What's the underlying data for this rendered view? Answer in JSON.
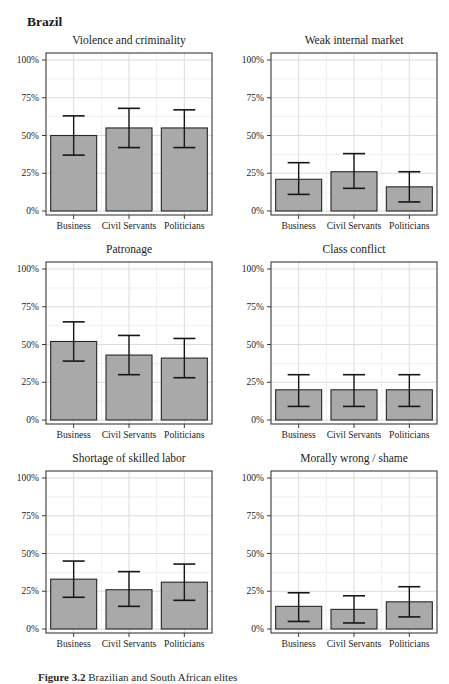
{
  "page": {
    "title": "Brazil",
    "caption": {
      "label": "Figure 3.2",
      "text": "Brazilian and South African elites"
    }
  },
  "style": {
    "bar_fill": "#a9a9a9",
    "bar_stroke": "#262626",
    "errorbar_color": "#161616",
    "grid_major_color": "#dcdcdc",
    "grid_minor_color": "#f0f0f0",
    "panel_border_color": "#3a3a3a",
    "tick_color": "#3a3a3a",
    "background": "#ffffff"
  },
  "axis": {
    "y_ticks_percent": [
      0,
      25,
      50,
      75,
      100
    ],
    "y_tick_labels": [
      "0%",
      "25%",
      "50%",
      "75%",
      "100%"
    ],
    "y_minor_ticks_percent": [
      12.5,
      37.5,
      62.5,
      87.5
    ],
    "ylim": [
      0,
      100
    ],
    "categories": [
      "Business",
      "Civil Servants",
      "Politicians"
    ]
  },
  "chart_data": [
    {
      "type": "bar",
      "title": "Violence and criminality",
      "categories": [
        "Business",
        "Civil Servants",
        "Politicians"
      ],
      "values": [
        50,
        55,
        55
      ],
      "ci_low": [
        37,
        42,
        42
      ],
      "ci_high": [
        63,
        68,
        67
      ],
      "ylim": [
        0,
        100
      ],
      "grid": true,
      "legend": "none"
    },
    {
      "type": "bar",
      "title": "Weak internal market",
      "categories": [
        "Business",
        "Civil Servants",
        "Politicians"
      ],
      "values": [
        21,
        26,
        16
      ],
      "ci_low": [
        11,
        15,
        6
      ],
      "ci_high": [
        32,
        38,
        26
      ],
      "ylim": [
        0,
        100
      ],
      "grid": true,
      "legend": "none"
    },
    {
      "type": "bar",
      "title": "Patronage",
      "categories": [
        "Business",
        "Civil Servants",
        "Politicians"
      ],
      "values": [
        52,
        43,
        41
      ],
      "ci_low": [
        39,
        30,
        28
      ],
      "ci_high": [
        65,
        56,
        54
      ],
      "ylim": [
        0,
        100
      ],
      "grid": true,
      "legend": "none"
    },
    {
      "type": "bar",
      "title": "Class conflict",
      "categories": [
        "Business",
        "Civil Servants",
        "Politicians"
      ],
      "values": [
        20,
        20,
        20
      ],
      "ci_low": [
        9,
        9,
        9
      ],
      "ci_high": [
        30,
        30,
        30
      ],
      "ylim": [
        0,
        100
      ],
      "grid": true,
      "legend": "none"
    },
    {
      "type": "bar",
      "title": "Shortage of skilled labor",
      "categories": [
        "Business",
        "Civil Servants",
        "Politicians"
      ],
      "values": [
        33,
        26,
        31
      ],
      "ci_low": [
        21,
        15,
        19
      ],
      "ci_high": [
        45,
        38,
        43
      ],
      "ylim": [
        0,
        100
      ],
      "grid": true,
      "legend": "none"
    },
    {
      "type": "bar",
      "title": "Morally wrong / shame",
      "categories": [
        "Business",
        "Civil Servants",
        "Politicians"
      ],
      "values": [
        15,
        13,
        18
      ],
      "ci_low": [
        5,
        4,
        8
      ],
      "ci_high": [
        24,
        22,
        28
      ],
      "ylim": [
        0,
        100
      ],
      "grid": true,
      "legend": "none"
    }
  ]
}
